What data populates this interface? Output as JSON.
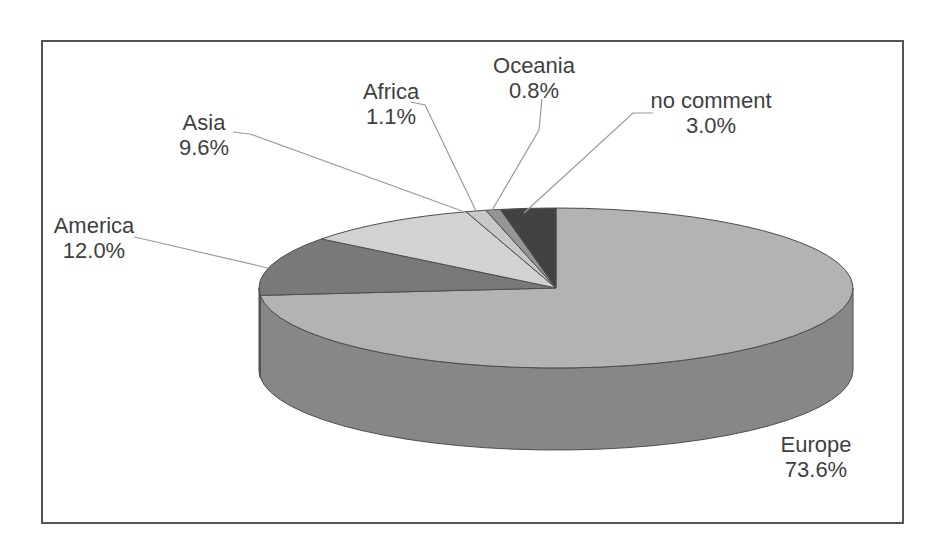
{
  "figure": {
    "kind": "scanned 3d pie chart figure",
    "background_color": "#ffffff",
    "frame_border_color": "#545454",
    "leader_line_color": "#9b9b9b",
    "slice_outline_color": "#4d4d4d",
    "text_color": "#3f3f3f"
  },
  "chart_data": {
    "type": "pie",
    "style": "3d",
    "unit": "%",
    "start_angle_deg": 0,
    "direction": "clockwise",
    "legend_position": "none",
    "title": "",
    "slices": [
      {
        "label": "Europe",
        "value": 73.6,
        "pct_label": "73.6%",
        "color": "#b3b3b3",
        "side_color": "#878787"
      },
      {
        "label": "America",
        "value": 12.0,
        "pct_label": "12.0%",
        "color": "#797979",
        "side_color": "#5e5e5e"
      },
      {
        "label": "Asia",
        "value": 9.6,
        "pct_label": "9.6%",
        "color": "#d2d2d2",
        "side_color": "#a8a8a8"
      },
      {
        "label": "Africa",
        "value": 1.1,
        "pct_label": "1.1%",
        "color": "#c8c8c8",
        "side_color": "#9e9e9e"
      },
      {
        "label": "Oceania",
        "value": 0.8,
        "pct_label": "0.8%",
        "color": "#959595",
        "side_color": "#6f6f6f"
      },
      {
        "label": "no comment",
        "value": 3.0,
        "pct_label": "3.0%",
        "color": "#424242",
        "side_color": "#2f2f2f"
      }
    ]
  }
}
